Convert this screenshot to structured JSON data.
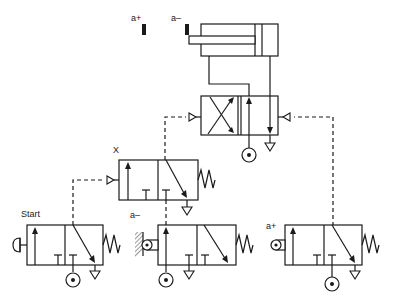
{
  "diagram": {
    "type": "pneumatic-circuit",
    "labels": {
      "sensor_a_plus": "a+",
      "sensor_a_minus": "a–",
      "memory_valve": "X",
      "start_valve": "Start",
      "limit_a_minus": "a–",
      "limit_a_plus": "a+"
    },
    "components": [
      {
        "id": "cylinder",
        "kind": "double-acting cylinder"
      },
      {
        "id": "main-valve",
        "kind": "5/2 pilot-operated valve"
      },
      {
        "id": "valve-x",
        "kind": "3/2 pilot-operated spring-return valve",
        "label": "X"
      },
      {
        "id": "start-valve",
        "kind": "3/2 push-button spring-return valve",
        "label": "Start"
      },
      {
        "id": "limit-valve-a-minus",
        "kind": "3/2 roller-operated spring-return valve",
        "label": "a–"
      },
      {
        "id": "limit-valve-a-plus",
        "kind": "3/2 roller-operated spring-return valve",
        "label": "a+"
      }
    ],
    "colors": {
      "line": "#1a1a1a",
      "background": "#ffffff"
    }
  }
}
